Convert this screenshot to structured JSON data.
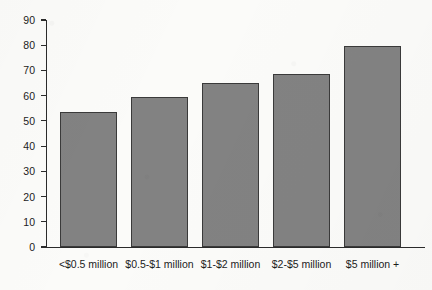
{
  "chart_data": {
    "type": "bar",
    "title": "",
    "subtitle": "",
    "xlabel": "",
    "ylabel": "",
    "categories": [
      "<$0.5 million",
      "$0.5-$1 million",
      "$1-$2 million",
      "$2-$5 million",
      "$5 million +"
    ],
    "values": [
      53.5,
      59.5,
      65,
      68.5,
      79.5
    ],
    "ylim": [
      0,
      90
    ],
    "ytick_labels": [
      "90",
      "80",
      "70",
      "60",
      "50",
      "40",
      "30",
      "20",
      "10",
      "0"
    ],
    "ytick_values": [
      90,
      80,
      70,
      60,
      50,
      40,
      30,
      20,
      10,
      0
    ],
    "grid": false,
    "legend": null,
    "bar_color": "#828282",
    "bar_border_color": "#3a3a3a",
    "axis_color": "#2b2b2b",
    "background_color": "#fbfbf9"
  }
}
